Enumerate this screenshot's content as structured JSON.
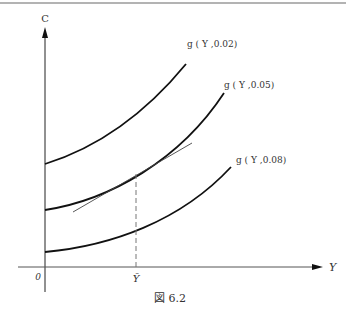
{
  "figure": {
    "caption": "図 6.2",
    "axes": {
      "y_label": "C",
      "x_label": "Y",
      "origin_label": "0",
      "x_marker_label": "Ȳ"
    },
    "curves": [
      {
        "label": "g ( Y ,0.02)",
        "name": "g(Y,0.02)"
      },
      {
        "label": "g ( Y ,0.05)",
        "name": "g(Y,0.05)"
      },
      {
        "label": "g ( Y ,0.08)",
        "name": "g(Y,0.08)"
      }
    ],
    "annotations": {
      "tangent_line": "tangent to g(Y,0.05) at Ȳ",
      "dashed_line": "vertical dashed line at Ȳ"
    }
  }
}
